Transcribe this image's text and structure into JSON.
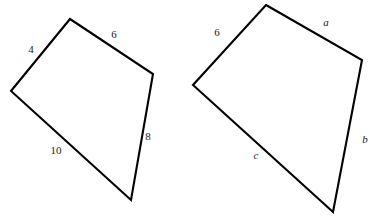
{
  "figure": {
    "background_color": "#ffffff",
    "stroke_color": "#000000",
    "text_color": "#1a1a1a",
    "width": 370,
    "height": 218,
    "shapes": [
      {
        "id": "left-quadrilateral",
        "name": "left-quadrilateral",
        "points": "70,19 153,74 131,200 11,91",
        "labels": [
          {
            "id": "left-side-top-right",
            "text": "6",
            "kind": "numeric",
            "x": 114,
            "y": 34
          },
          {
            "id": "left-side-top-left",
            "text": "4",
            "kind": "numeric",
            "x": 31,
            "y": 49
          },
          {
            "id": "left-side-right",
            "text": "8",
            "kind": "numeric",
            "x": 148,
            "y": 136
          },
          {
            "id": "left-side-bottom",
            "text": "10",
            "kind": "numeric",
            "x": 56,
            "y": 150
          }
        ]
      },
      {
        "id": "right-quadrilateral",
        "name": "right-quadrilateral",
        "points": "266,5 362,60 333,212 193,85",
        "labels": [
          {
            "id": "right-side-top-right",
            "text": "a",
            "kind": "variable",
            "x": 326,
            "y": 22
          },
          {
            "id": "right-side-top-left",
            "text": "6",
            "kind": "numeric",
            "x": 217,
            "y": 32
          },
          {
            "id": "right-side-right",
            "text": "b",
            "kind": "variable",
            "x": 365,
            "y": 139
          },
          {
            "id": "right-side-bottom",
            "text": "c",
            "kind": "variable",
            "x": 256,
            "y": 155
          }
        ]
      }
    ]
  }
}
